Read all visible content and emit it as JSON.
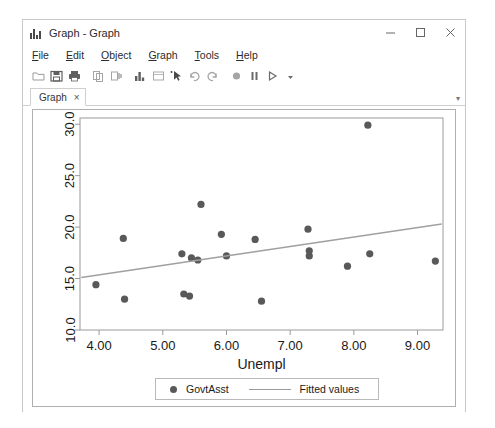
{
  "window": {
    "title": "Graph - Graph",
    "icon": "graph-bars-icon",
    "controls": {
      "minimize": "minimize-icon",
      "maximize": "maximize-icon",
      "close": "close-icon"
    }
  },
  "menubar": {
    "items": [
      {
        "label": "File",
        "accel": "F"
      },
      {
        "label": "Edit",
        "accel": "E"
      },
      {
        "label": "Object",
        "accel": "O"
      },
      {
        "label": "Graph",
        "accel": "G"
      },
      {
        "label": "Tools",
        "accel": "T"
      },
      {
        "label": "Help",
        "accel": "H"
      }
    ]
  },
  "toolbar": {
    "icons": [
      "open-folder-icon",
      "save-icon",
      "print-icon",
      "copy-icon",
      "paste-icon",
      "new-graph-icon",
      "rename-icon",
      "pointer-select-icon",
      "undo-icon",
      "redo-icon",
      "record-icon",
      "pause-icon",
      "play-icon",
      "dropdown-arrow-icon"
    ]
  },
  "tabs": {
    "items": [
      {
        "label": "Graph",
        "close": "×"
      }
    ],
    "overflow": "▾"
  },
  "chart_data": {
    "type": "scatter",
    "title": "",
    "xlabel": "Unempl",
    "ylabel": "",
    "xlim": [
      3.7,
      9.4
    ],
    "ylim": [
      10.0,
      30.6
    ],
    "xticks": [
      "4.00",
      "5.00",
      "6.00",
      "7.00",
      "8.00",
      "9.00"
    ],
    "xtick_values": [
      4.0,
      5.0,
      6.0,
      7.0,
      8.0,
      9.0
    ],
    "yticks": [
      "10.0",
      "15.0",
      "20.0",
      "25.0",
      "30.0"
    ],
    "ytick_values": [
      10.0,
      15.0,
      20.0,
      25.0,
      30.0
    ],
    "grid": false,
    "legend_position": "bottom-center",
    "marker_color": "#595959",
    "line_color": "#a0a0a0",
    "frame_color": "#9a9a9a",
    "series": [
      {
        "name": "GovtAsst",
        "type": "scatter",
        "points": [
          {
            "x": 3.95,
            "y": 14.4
          },
          {
            "x": 4.38,
            "y": 18.9
          },
          {
            "x": 4.4,
            "y": 13.0
          },
          {
            "x": 5.3,
            "y": 17.4
          },
          {
            "x": 5.33,
            "y": 13.5
          },
          {
            "x": 5.42,
            "y": 13.3
          },
          {
            "x": 5.45,
            "y": 17.0
          },
          {
            "x": 5.55,
            "y": 16.8
          },
          {
            "x": 5.6,
            "y": 22.2
          },
          {
            "x": 5.92,
            "y": 19.3
          },
          {
            "x": 6.0,
            "y": 17.2
          },
          {
            "x": 6.45,
            "y": 18.8
          },
          {
            "x": 6.55,
            "y": 12.8
          },
          {
            "x": 7.28,
            "y": 19.8
          },
          {
            "x": 7.3,
            "y": 17.7
          },
          {
            "x": 7.3,
            "y": 17.2
          },
          {
            "x": 7.9,
            "y": 16.2
          },
          {
            "x": 8.22,
            "y": 29.9
          },
          {
            "x": 8.25,
            "y": 17.4
          },
          {
            "x": 9.28,
            "y": 16.7
          }
        ]
      },
      {
        "name": "Fitted values",
        "type": "line",
        "points": [
          {
            "x": 3.72,
            "y": 15.1
          },
          {
            "x": 9.38,
            "y": 20.3
          }
        ]
      }
    ],
    "legend": [
      {
        "label": "GovtAsst",
        "marker": "dot"
      },
      {
        "label": "Fitted values",
        "marker": "line"
      }
    ]
  }
}
